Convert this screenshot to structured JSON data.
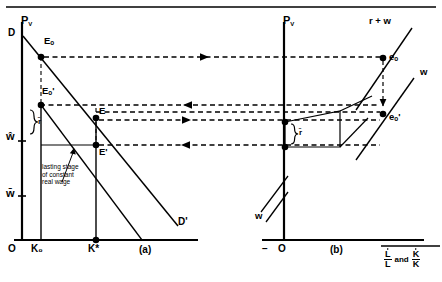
{
  "figure": {
    "type": "economics-diagram",
    "title": "",
    "panels": [
      {
        "id": "a",
        "caption": "(a)",
        "y_axis_label": "P_V",
        "origin_label": "O",
        "curves": [
          {
            "name": "demand-curve-D-Dprime",
            "start_label": "D",
            "end_label": "D'"
          },
          {
            "name": "secondary-ray"
          }
        ],
        "axis_ticks_y": [
          {
            "label": "w-hat",
            "text": "ŵ"
          },
          {
            "label": "w-bar",
            "text": "w̄"
          }
        ],
        "axis_ticks_x": [
          {
            "label": "K-zero",
            "text": "K₀"
          },
          {
            "label": "K-star",
            "text": "K*"
          }
        ],
        "points": [
          {
            "name": "E0",
            "text": "Eₒ"
          },
          {
            "name": "E0-prime",
            "text": "Eₒ'"
          },
          {
            "name": "E",
            "text": "E"
          },
          {
            "name": "E-prime",
            "text": "E'"
          }
        ],
        "brace_label": "r̄",
        "annotation": "lasting stage\nof constant\nreal wage"
      },
      {
        "id": "b",
        "caption": "(b)",
        "y_axis_label": "P_V",
        "origin_label": "O",
        "origin_prefix": "−",
        "curves": [
          {
            "name": "r-plus-w-line",
            "label": "r + w"
          },
          {
            "name": "w-line-upper",
            "label": "w"
          },
          {
            "name": "w-line-lower",
            "label": "w"
          }
        ],
        "points": [
          {
            "name": "e0",
            "text": "eₒ"
          },
          {
            "name": "e0-prime",
            "text": "eₒ'"
          }
        ],
        "brace_label": "r̄",
        "x_axis_label": {
          "frac1_num": "L",
          "frac1_den": "L",
          "conjunction": "and",
          "frac2_num": "K",
          "frac2_den": "K"
        }
      }
    ],
    "flow_arrows": [
      {
        "name": "arrow-top-right",
        "direction": "right"
      },
      {
        "name": "arrow-mid-left",
        "direction": "left"
      },
      {
        "name": "arrow-mid-right",
        "direction": "right"
      },
      {
        "name": "arrow-bottom-left",
        "direction": "left"
      },
      {
        "name": "arrow-down-panel-b",
        "direction": "down"
      }
    ],
    "colors": {
      "ink": "#000000",
      "paper": "#ffffff"
    }
  }
}
